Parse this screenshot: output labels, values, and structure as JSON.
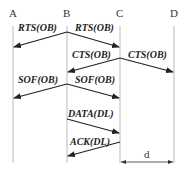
{
  "diagram": {
    "type": "sequence",
    "nodes": [
      {
        "id": "A",
        "label": "A",
        "x": 13
      },
      {
        "id": "B",
        "label": "B",
        "x": 67
      },
      {
        "id": "C",
        "label": "C",
        "x": 120
      },
      {
        "id": "D",
        "label": "D",
        "x": 174
      }
    ],
    "messages": [
      {
        "label": "RTS(OB)",
        "from": "B",
        "to": "A"
      },
      {
        "label": "RTS(OB)",
        "from": "B",
        "to": "C"
      },
      {
        "label": "CTS(OB)",
        "from": "C",
        "to": "B"
      },
      {
        "label": "CTS(OB)",
        "from": "C",
        "to": "D"
      },
      {
        "label": "SOF(OB)",
        "from": "B",
        "to": "A"
      },
      {
        "label": "SOF(OB)",
        "from": "B",
        "to": "C"
      },
      {
        "label": "DATA(DL)",
        "from": "B",
        "to": "C"
      },
      {
        "label": "ACK(DL)",
        "from": "C",
        "to": "B"
      }
    ],
    "distance": {
      "label": "d",
      "from": "C",
      "to": "D"
    }
  }
}
